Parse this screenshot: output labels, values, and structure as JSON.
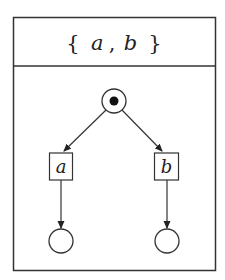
{
  "diagram": {
    "title": {
      "open_brace": "{",
      "a": "a",
      "comma": ",",
      "b": "b",
      "close_brace": "}"
    },
    "initial_state": {
      "type": "initial-marked-circle"
    },
    "nodes": [
      {
        "id": "a",
        "label": "a"
      },
      {
        "id": "b",
        "label": "b"
      }
    ],
    "final_states": [
      {
        "id": "end-a"
      },
      {
        "id": "end-b"
      }
    ],
    "edges": [
      {
        "from": "initial",
        "to": "a"
      },
      {
        "from": "initial",
        "to": "b"
      },
      {
        "from": "a",
        "to": "end-a"
      },
      {
        "from": "b",
        "to": "end-b"
      }
    ],
    "colors": {
      "stroke": "#333333",
      "background": "#ffffff"
    }
  }
}
